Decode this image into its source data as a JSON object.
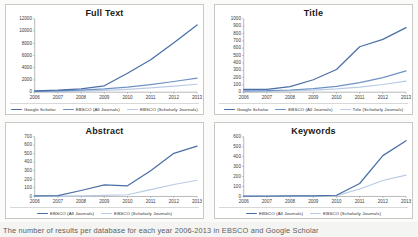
{
  "page": {
    "background_color": "#f4f4f2",
    "caption_fragment": "The number of results per database for each year 2006-2013 in EBSCO and Google Scholar"
  },
  "colors": {
    "google_scholar": "#4a6fa5",
    "ebsco_all": "#6f92c4",
    "ebsco_scholarly": "#b9cbe4",
    "axis": "#9a9a9a",
    "panel_border": "#c8c8c6",
    "title_text": "#1a1a1a"
  },
  "chart_data": [
    {
      "id": "full-text",
      "type": "line",
      "title": "Full Text",
      "xlabel": "",
      "ylabel": "",
      "grid": false,
      "legend_position": "bottom",
      "categories": [
        "2006",
        "2007",
        "2008",
        "2009",
        "2010",
        "2011",
        "2012",
        "2013"
      ],
      "ylim": [
        0,
        12000
      ],
      "yticks": [
        0,
        2000,
        4000,
        6000,
        8000,
        10000,
        12000
      ],
      "ytick_labels": [
        "0",
        "2000",
        "4000",
        "6000",
        "8000",
        "10000",
        "12000"
      ],
      "series": [
        {
          "name": "Google Scholar",
          "color": "#4a6fa5",
          "values": [
            220,
            330,
            540,
            1050,
            3100,
            5300,
            8100,
            11000
          ]
        },
        {
          "name": "EBSCO (All Journals)",
          "color": "#6f92c4",
          "values": [
            150,
            220,
            330,
            530,
            830,
            1250,
            1750,
            2300
          ]
        },
        {
          "name": "EBSCO (Scholarly Journals)",
          "color": "#b9cbe4",
          "values": [
            80,
            120,
            190,
            300,
            470,
            700,
            1000,
            1300
          ]
        }
      ]
    },
    {
      "id": "title",
      "type": "line",
      "title": "Title",
      "xlabel": "",
      "ylabel": "",
      "grid": false,
      "legend_position": "bottom",
      "categories": [
        "2006",
        "2007",
        "2008",
        "2009",
        "2010",
        "2011",
        "2012",
        "2013"
      ],
      "ylim": [
        0,
        1000
      ],
      "yticks": [
        0,
        100,
        200,
        300,
        400,
        500,
        600,
        700,
        800,
        900,
        1000
      ],
      "ytick_labels": [
        "0",
        "100",
        "200",
        "300",
        "400",
        "500",
        "600",
        "700",
        "800",
        "900",
        "1000"
      ],
      "series": [
        {
          "name": "Google Scholar",
          "color": "#4a6fa5",
          "values": [
            40,
            40,
            75,
            170,
            310,
            620,
            720,
            880
          ]
        },
        {
          "name": "EBSCO (All Journals)",
          "color": "#6f92c4",
          "values": [
            18,
            20,
            30,
            50,
            80,
            130,
            200,
            290
          ]
        },
        {
          "name": "Title (Scholarly Journals)",
          "color": "#b9cbe4",
          "values": [
            10,
            12,
            18,
            28,
            45,
            70,
            105,
            150
          ]
        }
      ]
    },
    {
      "id": "abstract",
      "type": "line",
      "title": "Abstract",
      "xlabel": "",
      "ylabel": "",
      "grid": false,
      "legend_position": "bottom",
      "categories": [
        "2006",
        "2007",
        "2008",
        "2009",
        "2010",
        "2011",
        "2012",
        "2013"
      ],
      "ylim": [
        0,
        700
      ],
      "yticks": [
        0,
        100,
        200,
        300,
        400,
        500,
        600,
        700
      ],
      "ytick_labels": [
        "0",
        "100",
        "200",
        "300",
        "400",
        "500",
        "600",
        "700"
      ],
      "series": [
        {
          "name": "EBSCO (All Journals)",
          "color": "#4a6fa5",
          "values": [
            8,
            10,
            70,
            135,
            125,
            300,
            505,
            590
          ]
        },
        {
          "name": "EBSCO (Scholarly Journals)",
          "color": "#b9cbe4",
          "values": [
            4,
            5,
            8,
            12,
            20,
            80,
            140,
            190
          ]
        }
      ]
    },
    {
      "id": "keywords",
      "type": "line",
      "title": "Keywords",
      "xlabel": "",
      "ylabel": "",
      "grid": false,
      "legend_position": "bottom",
      "categories": [
        "2006",
        "2007",
        "2008",
        "2009",
        "2010",
        "2011",
        "2012",
        "2013"
      ],
      "ylim": [
        0,
        600
      ],
      "yticks": [
        0,
        100,
        200,
        300,
        400,
        500,
        600
      ],
      "ytick_labels": [
        "0",
        "100",
        "200",
        "300",
        "400",
        "500",
        "600"
      ],
      "series": [
        {
          "name": "EBSCO (All Journals)",
          "color": "#4a6fa5",
          "values": [
            4,
            4,
            5,
            6,
            12,
            130,
            410,
            560
          ]
        },
        {
          "name": "EBSCO (Scholarly Journals)",
          "color": "#b9cbe4",
          "values": [
            2,
            2,
            3,
            4,
            8,
            75,
            160,
            215
          ]
        }
      ]
    }
  ]
}
